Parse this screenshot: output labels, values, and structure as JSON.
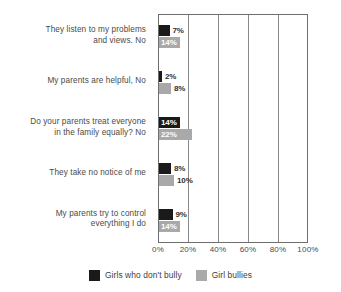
{
  "chart_data": {
    "type": "bar",
    "orientation": "horizontal",
    "title": "",
    "xlabel": "",
    "ylabel": "",
    "xlim": [
      0,
      100
    ],
    "xticks": [
      "0%",
      "20%",
      "40%",
      "60%",
      "80%",
      "100%"
    ],
    "xtick_values": [
      0,
      20,
      40,
      60,
      80,
      100
    ],
    "grid": true,
    "legend_position": "bottom",
    "categories": [
      "They listen to my problems and views. No",
      "My parents are helpful, No",
      "Do your parents treat everyone in the family equally? No",
      "They take no notice of me",
      "My parents try to control everything I do"
    ],
    "category_lines": [
      [
        "They listen to my problems",
        "and views. No"
      ],
      [
        "My parents are helpful, No"
      ],
      [
        "Do your parents treat everyone",
        "in the family equally? No"
      ],
      [
        "They take no notice of me"
      ],
      [
        "My parents try to control",
        "everything I do"
      ]
    ],
    "series": [
      {
        "name": "Girls who don't bully",
        "color": "#1a1a1a",
        "values": [
          7,
          2,
          14,
          8,
          9
        ],
        "labels": [
          "7%",
          "2%",
          "14%",
          "8%",
          "9%"
        ],
        "label_placement": [
          "outside",
          "outside",
          "inside",
          "outside",
          "outside"
        ]
      },
      {
        "name": "Girl bullies",
        "color": "#a9a9a9",
        "values": [
          14,
          8,
          22,
          10,
          14
        ],
        "labels": [
          "14%",
          "8%",
          "22%",
          "10%",
          "14%"
        ],
        "label_placement": [
          "inside",
          "outside",
          "inside",
          "outside",
          "inside"
        ]
      }
    ]
  },
  "legend": {
    "items": [
      {
        "label": "Girls who don't bully",
        "color": "#1a1a1a"
      },
      {
        "label": "Girl bullies",
        "color": "#a9a9a9"
      }
    ]
  },
  "axis": {
    "ticks": [
      {
        "label": "0%",
        "value": 0
      },
      {
        "label": "20%",
        "value": 20
      },
      {
        "label": "40%",
        "value": 40
      },
      {
        "label": "60%",
        "value": 60
      },
      {
        "label": "80%",
        "value": 80
      },
      {
        "label": "100%",
        "value": 100
      }
    ]
  },
  "colors": {
    "dark_series": "#1a1a1a",
    "light_series": "#a9a9a9",
    "axis_line": "#6e6e6e",
    "gridline": "#8a8a8a",
    "text": "#4a4a4a",
    "background": "#ffffff"
  }
}
